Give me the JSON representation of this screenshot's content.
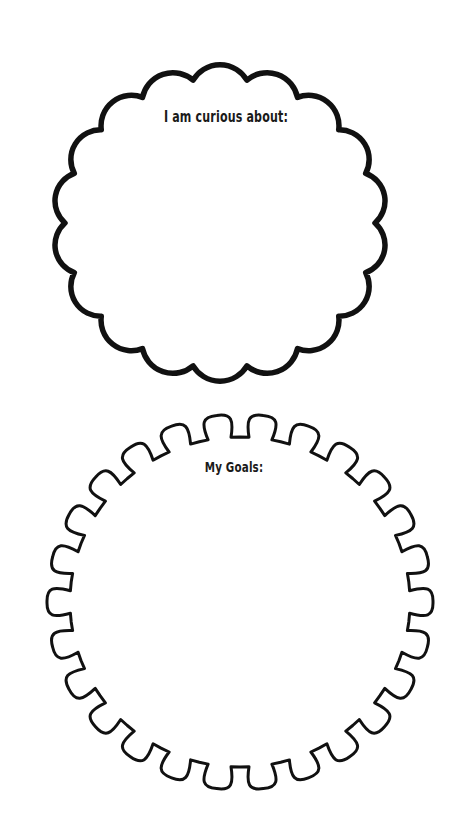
{
  "worksheet": {
    "background_color": "#ffffff",
    "stroke_color": "#111111",
    "sections": [
      {
        "id": "curious",
        "label": "I am curious about:",
        "shape": "scalloped-cloud",
        "center": [
          220,
          223
        ],
        "radius": [
          155,
          145
        ],
        "bumps": 18,
        "bump_depth": 12,
        "stroke_width": 5.5
      },
      {
        "id": "goals",
        "label": "My Goals:",
        "shape": "wavy-gear-circle",
        "center": [
          240,
          602
        ],
        "radius": [
          170,
          165
        ],
        "bumps": 26,
        "bump_depth": 20,
        "stroke_width": 3
      }
    ]
  }
}
